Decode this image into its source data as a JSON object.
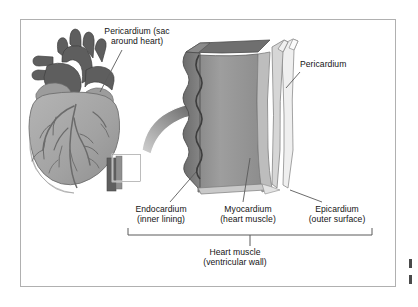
{
  "figure": {
    "background_color": "#ffffff",
    "frame_color": "#b0b0b0",
    "text_color": "#141414"
  },
  "labels": {
    "pericardium_sac": "Pericardium (sac\naround heart)",
    "pericardium_right": "Pericardium",
    "endocardium": "Endocardium\n(inner lining)",
    "myocardium": "Myocardium\n(heart muscle)",
    "epicardium": "Epicardium\n(outer surface)",
    "heart_muscle": "Heart muscle\n(ventricular wall)"
  },
  "diagram": {
    "heart_illustration_name": "anterior-heart-with-coronary-vessels",
    "callout_box_name": "ventricular-wall-sample-box",
    "arrow_name": "magnification-arrow",
    "block_name": "heart-wall-cross-section-block",
    "bracket_name": "heart-muscle-span-bracket",
    "layers": [
      {
        "name": "endocardium",
        "position": "inner",
        "shade": "#8e8e8e"
      },
      {
        "name": "myocardium",
        "position": "middle",
        "shade": "#9a9a9a"
      },
      {
        "name": "epicardium",
        "position": "outer",
        "shade": "#d9d9d9"
      },
      {
        "name": "pericardium",
        "position": "outermost sac",
        "shade": "#ececec"
      }
    ],
    "colors": {
      "great_vessels": "#5e5e5e",
      "ventricle_body": "#a6a6a6",
      "coronary_vessels": "#6b6b6b",
      "block_dark": "#6f6f6f",
      "block_mid": "#8e8e8e",
      "block_light": "#a8a8a8",
      "leader_line": "#5a5a5a"
    }
  }
}
